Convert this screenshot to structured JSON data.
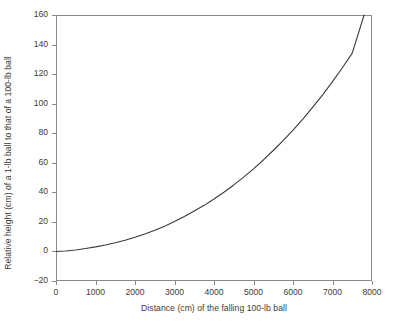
{
  "chart_data": {
    "type": "line",
    "title": "",
    "xlabel": "Distance (cm) of the falling 100-lb ball",
    "ylabel": "Relative height (cm) of a 1-lb ball to that of a 100-lb ball",
    "xlim": [
      0,
      8000
    ],
    "ylim": [
      -20,
      160
    ],
    "xticks": [
      0,
      1000,
      2000,
      3000,
      4000,
      5000,
      6000,
      7000,
      8000
    ],
    "xtick_labels": [
      "0",
      "1000",
      "2000",
      "3000",
      "4000",
      "5000",
      "6000",
      "7000",
      "8000"
    ],
    "yticks": [
      -20,
      0,
      20,
      40,
      60,
      80,
      100,
      120,
      140,
      160
    ],
    "ytick_labels": [
      "−20",
      "0",
      "20",
      "40",
      "60",
      "80",
      "100",
      "120",
      "140",
      "160"
    ],
    "grid": false,
    "legend": null,
    "series": [
      {
        "name": "relative height",
        "color": "#3a3a3a",
        "x": [
          0,
          250,
          500,
          750,
          1000,
          1250,
          1500,
          1750,
          2000,
          2250,
          2500,
          2750,
          3000,
          3250,
          3500,
          3750,
          4000,
          4250,
          4500,
          4750,
          5000,
          5250,
          5500,
          5750,
          6000,
          6250,
          6500,
          6750,
          7000,
          7250,
          7500,
          7800
        ],
        "y": [
          0.0,
          0.3,
          1.0,
          2.0,
          3.1,
          4.4,
          5.9,
          7.6,
          9.6,
          11.8,
          14.3,
          17.1,
          20.2,
          23.6,
          27.3,
          31.2,
          35.5,
          40.1,
          45.0,
          50.3,
          55.9,
          61.9,
          68.3,
          75.0,
          82.1,
          89.6,
          97.6,
          106.0,
          114.9,
          124.3,
          134.2,
          160.0
        ],
        "linewidth": 1.1
      }
    ],
    "axes_color": "#8a8a8a",
    "background": "#ffffff"
  }
}
